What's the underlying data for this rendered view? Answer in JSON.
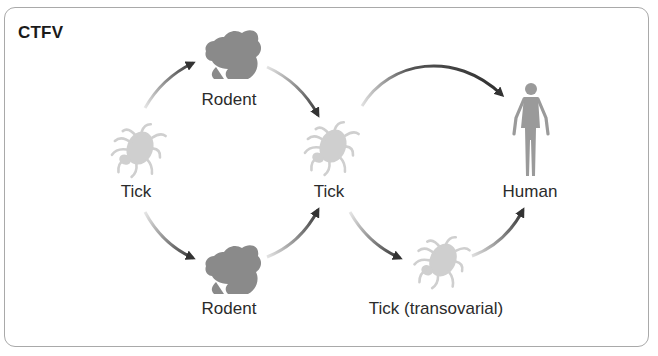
{
  "title": "CTFV",
  "nodes": {
    "tick_start": {
      "label": "Tick",
      "icon": "tick-icon"
    },
    "rodent_top": {
      "label": "Rodent",
      "icon": "squirrel-icon"
    },
    "rodent_bottom": {
      "label": "Rodent",
      "icon": "squirrel-icon"
    },
    "tick_middle": {
      "label": "Tick",
      "icon": "tick-icon"
    },
    "tick_transovarial": {
      "label": "Tick (transovarial)",
      "icon": "tick-icon"
    },
    "human": {
      "label": "Human",
      "icon": "human-figure-icon"
    }
  },
  "edges": [
    {
      "from": "tick_start",
      "to": "rodent_top"
    },
    {
      "from": "rodent_top",
      "to": "tick_middle"
    },
    {
      "from": "tick_start",
      "to": "rodent_bottom"
    },
    {
      "from": "rodent_bottom",
      "to": "tick_middle"
    },
    {
      "from": "tick_middle",
      "to": "human"
    },
    {
      "from": "tick_middle",
      "to": "tick_transovarial"
    },
    {
      "from": "tick_transovarial",
      "to": "human"
    }
  ],
  "colors": {
    "frame_border": "#a9a9a9",
    "arrow": "#3a3a3a",
    "rodent": "#8a8a8a",
    "tick": "#cfcfcf",
    "human": "#9a9a9a",
    "text": "#2b2b2b"
  }
}
